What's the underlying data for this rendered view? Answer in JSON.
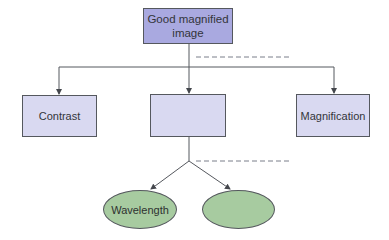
{
  "diagram": {
    "root": {
      "label": "Good magnified image"
    },
    "level1": [
      {
        "label": "Contrast"
      },
      {
        "label": ""
      },
      {
        "label": "Magnification"
      }
    ],
    "level2": [
      {
        "label": "Wavelength"
      },
      {
        "label": ""
      }
    ],
    "colors": {
      "root_fill": "#a9a9e0",
      "box_fill": "#d9d9f1",
      "ellipse_fill": "#a7cba0",
      "line": "#55585e",
      "dash": "#7a7f8a"
    }
  }
}
